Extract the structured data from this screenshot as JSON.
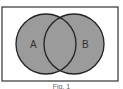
{
  "diagram": {
    "type": "venn",
    "sets": [
      {
        "label": "A",
        "cx": 46,
        "cy": 44,
        "r": 30
      },
      {
        "label": "B",
        "cx": 74,
        "cy": 44,
        "r": 30
      }
    ],
    "frame": {
      "x": 2,
      "y": 7,
      "width": 116,
      "height": 74
    },
    "colors": {
      "fill": "#9b9b9b",
      "stroke": "#222222",
      "frame": "#333333",
      "background": "#ffffff"
    },
    "caption": "Fig. 1"
  }
}
